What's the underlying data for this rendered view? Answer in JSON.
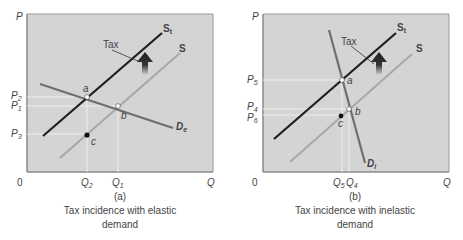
{
  "figure": {
    "panels": [
      {
        "id": "a",
        "tag": "(a)",
        "caption_line1": "Tax incidence with elastic",
        "caption_line2": "demand",
        "axis": {
          "y": "P",
          "x": "Q",
          "origin": "0"
        },
        "curves": {
          "supply_taxed": "S",
          "supply_taxed_sub": "t",
          "supply": "S",
          "demand": "D",
          "demand_sub": "e"
        },
        "tax_label": "Tax",
        "points": {
          "a": "a",
          "b": "b",
          "c": "c"
        },
        "prices": [
          {
            "base": "P",
            "sub": "2"
          },
          {
            "base": "P",
            "sub": "1"
          },
          {
            "base": "P",
            "sub": "3"
          }
        ],
        "quantities": [
          {
            "base": "Q",
            "sub": "2"
          },
          {
            "base": "Q",
            "sub": "1"
          }
        ]
      },
      {
        "id": "b",
        "tag": "(b)",
        "caption_line1": "Tax incidence with inelastic",
        "caption_line2": "demand",
        "axis": {
          "y": "P",
          "x": "Q",
          "origin": "0"
        },
        "curves": {
          "supply_taxed": "S",
          "supply_taxed_sub": "t",
          "supply": "S",
          "demand": "D",
          "demand_sub": "i"
        },
        "tax_label": "Tax",
        "points": {
          "a": "a",
          "b": "b",
          "c": "c"
        },
        "prices": [
          {
            "base": "P",
            "sub": "5"
          },
          {
            "base": "P",
            "sub": "4"
          },
          {
            "base": "P",
            "sub": "6"
          }
        ],
        "quantities": [
          {
            "base": "Q",
            "sub": "5"
          },
          {
            "base": "Q",
            "sub": "4"
          }
        ]
      }
    ],
    "colors": {
      "plot_bg": "#d4d4d4",
      "axis": "#8a8a8a",
      "supply_taxed": "#1e1e1e",
      "supply": "#a8a8a8",
      "demand": "#6e6e6e",
      "guide": "#f2f2f2",
      "arrow": "#2a2a2a"
    }
  }
}
